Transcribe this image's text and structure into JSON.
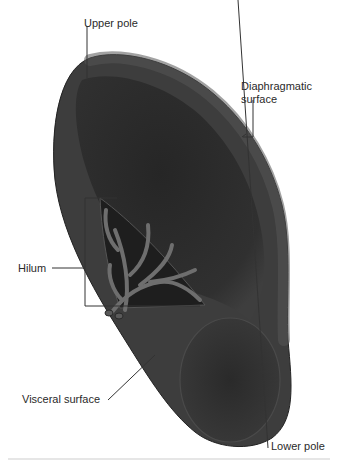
{
  "figure": {
    "colors": {
      "organ_dark": "#2b2b2b",
      "organ_mid": "#3d3d3d",
      "organ_rim": "#505050",
      "vessel": "#6a6a6a",
      "leader_line": "#333333",
      "text": "#2a2a2a"
    }
  },
  "labels": {
    "upper_pole": "Upper pole",
    "diaphragmatic_surface_line1": "Diaphragmatic",
    "diaphragmatic_surface_line2": "surface",
    "hilum": "Hilum",
    "visceral_surface": "Visceral surface",
    "lower_pole": "Lower pole"
  }
}
